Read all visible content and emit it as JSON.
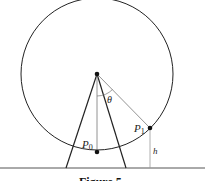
{
  "diagram": {
    "labels": {
      "theta": "θ",
      "p0": "P",
      "p0_sub": "0",
      "p1": "P",
      "p1_sub": "1",
      "h": "h"
    },
    "caption": "Figure 5",
    "geometry": {
      "center": [
        97,
        74
      ],
      "radius": 76,
      "ground_y": 168,
      "p0": [
        97,
        152
      ],
      "p1": [
        150,
        128
      ],
      "leg_left_foot": [
        66,
        168
      ],
      "leg_right_foot": [
        126,
        168
      ]
    }
  }
}
